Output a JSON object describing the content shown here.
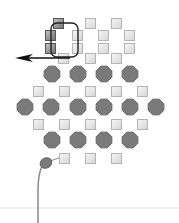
{
  "diagram": {
    "background": "#ffffff",
    "colors": {
      "square_light_fill": "#e8e8e8",
      "square_light_stroke": "#b4b4b4",
      "square_dark_fill": "#9a9a9a",
      "square_dark_stroke": "#555555",
      "octagon_fill": "#7a7a7a",
      "octagon_stroke": "#666666",
      "outline_stroke": "#222222",
      "arrow_stroke": "#111111",
      "stem_stroke": "#888888",
      "baseline_stroke": "#e6e6e6"
    },
    "squares_dark": [
      {
        "x": 53,
        "y": 18
      },
      {
        "x": 45,
        "y": 30
      },
      {
        "x": 45,
        "y": 43
      }
    ],
    "squares_light": [
      {
        "x": 85,
        "y": 18
      },
      {
        "x": 111,
        "y": 18
      },
      {
        "x": 72,
        "y": 30
      },
      {
        "x": 98,
        "y": 30
      },
      {
        "x": 124,
        "y": 30
      },
      {
        "x": 72,
        "y": 43
      },
      {
        "x": 98,
        "y": 43
      },
      {
        "x": 124,
        "y": 43
      },
      {
        "x": 58,
        "y": 53
      },
      {
        "x": 85,
        "y": 53
      },
      {
        "x": 111,
        "y": 53
      },
      {
        "x": 33,
        "y": 86
      },
      {
        "x": 59,
        "y": 86
      },
      {
        "x": 85,
        "y": 86
      },
      {
        "x": 111,
        "y": 86
      },
      {
        "x": 137,
        "y": 86
      },
      {
        "x": 33,
        "y": 119
      },
      {
        "x": 59,
        "y": 119
      },
      {
        "x": 85,
        "y": 119
      },
      {
        "x": 111,
        "y": 119
      },
      {
        "x": 137,
        "y": 119
      },
      {
        "x": 59,
        "y": 153
      },
      {
        "x": 85,
        "y": 153
      },
      {
        "x": 111,
        "y": 153
      }
    ],
    "octagons": [
      {
        "cx": 52,
        "cy": 74
      },
      {
        "cx": 78,
        "cy": 74
      },
      {
        "cx": 104,
        "cy": 74
      },
      {
        "cx": 130,
        "cy": 74
      },
      {
        "cx": 25,
        "cy": 107
      },
      {
        "cx": 51,
        "cy": 107
      },
      {
        "cx": 78,
        "cy": 107
      },
      {
        "cx": 104,
        "cy": 107
      },
      {
        "cx": 130,
        "cy": 107
      },
      {
        "cx": 156,
        "cy": 107
      },
      {
        "cx": 52,
        "cy": 140
      },
      {
        "cx": 78,
        "cy": 140
      },
      {
        "cx": 104,
        "cy": 140
      },
      {
        "cx": 130,
        "cy": 140
      }
    ],
    "selection_outline": {
      "x": 51,
      "y": 23,
      "w": 27,
      "h": 34,
      "r": 6
    },
    "arrow": {
      "x1": 70,
      "y1": 58,
      "x2": 15,
      "y2": 58
    },
    "connector": {
      "x1": 50,
      "y1": 161,
      "x2": 59,
      "y2": 158
    },
    "pin": {
      "cx": 46,
      "cy": 163,
      "rx": 6,
      "ry": 5
    },
    "stem": {
      "path": "M42 166 Q38 175 38 190 L38 223"
    },
    "baseline": {
      "y": 208
    }
  }
}
